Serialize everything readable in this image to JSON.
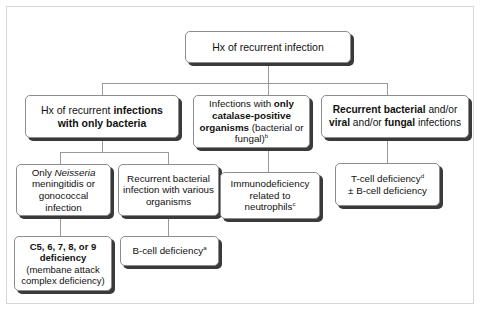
{
  "diagram": {
    "type": "flowchart",
    "frame_border_color": "#d6d6d6",
    "node_border_color": "#8c8c8c",
    "node_shadow_color": "#3a3a3a",
    "connector_color": "#9a9a9a",
    "background": "#ffffff"
  },
  "nodes": {
    "root": {
      "id": "root",
      "text": "Hx of recurrent infection",
      "segments": [
        {
          "text": "Hx of recurrent infection",
          "style": "normal"
        }
      ]
    },
    "bacteria_only": {
      "id": "bacteria-only",
      "text": "Hx of recurrent infections with only bacteria",
      "segments": [
        {
          "text": "Hx of recurrent ",
          "style": "normal"
        },
        {
          "text": "infections with only bacteria",
          "style": "bold"
        }
      ]
    },
    "catalase_positive": {
      "id": "catalase-positive",
      "text": "Infections with only catalase-positive organisms (bacterial or fungal)b",
      "segments": [
        {
          "text": "Infections with ",
          "style": "normal"
        },
        {
          "text": "only catalase-positive organisms",
          "style": "bold"
        },
        {
          "text": " (bacterial or fungal)",
          "style": "normal"
        },
        {
          "text": "b",
          "style": "superscript"
        }
      ]
    },
    "recurrent_mixed": {
      "id": "recurrent-mixed",
      "text": "Recurrent bacterial and/or viral and/or fungal infections",
      "segments": [
        {
          "text": "Recurrent bacterial",
          "style": "bold"
        },
        {
          "text": " and/or ",
          "style": "normal"
        },
        {
          "text": "viral",
          "style": "bold"
        },
        {
          "text": " and/or ",
          "style": "normal"
        },
        {
          "text": "fungal",
          "style": "bold"
        },
        {
          "text": " infections",
          "style": "normal"
        }
      ]
    },
    "neisseria": {
      "id": "neisseria",
      "text": "Only Neisseria meningitidis or gonococcal infection",
      "segments": [
        {
          "text": "Only ",
          "style": "normal"
        },
        {
          "text": "Neisseria",
          "style": "italic"
        },
        {
          "text": " meningitidis or gonococcal infection",
          "style": "normal"
        }
      ]
    },
    "various_organisms": {
      "id": "various-organisms",
      "text": "Recurrent bacterial infection with various organisms",
      "segments": [
        {
          "text": "Recurrent bacterial infection with various organisms",
          "style": "normal"
        }
      ]
    },
    "neutrophils": {
      "id": "neutrophils",
      "text": "Immunodeficiency related to neutrophilsc",
      "segments": [
        {
          "text": "Immunodeficiency related to neutrophils",
          "style": "normal"
        },
        {
          "text": "c",
          "style": "superscript"
        }
      ]
    },
    "tcell": {
      "id": "tcell-deficiency",
      "text": "T-cell deficiencyd ± B-cell deficiency",
      "segments": [
        {
          "text": "T-cell deficiency",
          "style": "normal"
        },
        {
          "text": "d",
          "style": "superscript"
        },
        {
          "text": "\n± B-cell deficiency",
          "style": "normal"
        }
      ]
    },
    "complement": {
      "id": "complement-deficiency",
      "text": "C5, 6, 7, 8, or 9 deficiency (membane attack complex deficiency)",
      "segments": [
        {
          "text": "C5, 6, 7, 8, or 9 deficiency",
          "style": "bold"
        },
        {
          "text": " (membane attack complex deficiency)",
          "style": "normal"
        }
      ]
    },
    "bcell": {
      "id": "bcell-deficiency",
      "text": "B-cell deficiencya",
      "segments": [
        {
          "text": "B-cell deficiency",
          "style": "normal"
        },
        {
          "text": "a",
          "style": "superscript"
        }
      ]
    }
  },
  "edges": [
    {
      "from": "root",
      "to": "bacteria_only"
    },
    {
      "from": "root",
      "to": "catalase_positive"
    },
    {
      "from": "root",
      "to": "recurrent_mixed"
    },
    {
      "from": "bacteria_only",
      "to": "neisseria"
    },
    {
      "from": "bacteria_only",
      "to": "various_organisms"
    },
    {
      "from": "catalase_positive",
      "to": "neutrophils"
    },
    {
      "from": "recurrent_mixed",
      "to": "tcell"
    },
    {
      "from": "neisseria",
      "to": "complement"
    },
    {
      "from": "various_organisms",
      "to": "bcell"
    }
  ]
}
